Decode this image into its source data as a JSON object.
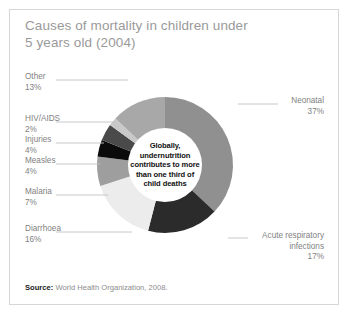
{
  "title": "Causes of mortality in children under 5 years old (2004)",
  "center_note": "Globally, undernutrition contributes to more than one third of child deaths",
  "footer": {
    "label": "Source:",
    "text": "World Health Organization, 2008."
  },
  "labels": {
    "other": {
      "name": "Other",
      "pct": "13%"
    },
    "hiv": {
      "name": "HIV/AIDS",
      "pct": "2%"
    },
    "injuries": {
      "name": "Injuries",
      "pct": "4%"
    },
    "measles": {
      "name": "Measles",
      "pct": "4%"
    },
    "malaria": {
      "name": "Malaria",
      "pct": "7%"
    },
    "diarrhoea": {
      "name": "Diarrhoea",
      "pct": "16%"
    },
    "neonatal": {
      "name": "Neonatal",
      "pct": "37%"
    },
    "ari_line1": "Acute respiratory",
    "ari_line2": "infections",
    "ari_pct": "17%"
  },
  "chart_data": {
    "type": "pie",
    "title": "Causes of mortality in children under 5 years old (2004)",
    "subtype": "donut",
    "units": "percent of deaths",
    "legend": "none-callout-labels",
    "grid": false,
    "categories": [
      "Neonatal",
      "Acute respiratory infections",
      "Diarrhoea",
      "Malaria",
      "Measles",
      "Injuries",
      "HIV/AIDS",
      "Other"
    ],
    "values": [
      37,
      17,
      16,
      7,
      4,
      4,
      2,
      13
    ],
    "colors": [
      "#909090",
      "#2b2b2b",
      "#ececec",
      "#9e9e9e",
      "#0b0b0b",
      "#4a4a4a",
      "#c9c9c9",
      "#a8a8a8"
    ],
    "start_angle_deg": 0,
    "direction": "clockwise",
    "inner_radius_ratio": 0.54,
    "annotation": "Globally, undernutrition contributes to more than one third of child deaths",
    "source": "World Health Organization, 2008."
  }
}
